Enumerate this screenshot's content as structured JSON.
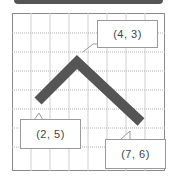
{
  "diagram": {
    "type": "coordinate-grid-with-bent-bar",
    "grid": {
      "columns": 8,
      "rows": 8,
      "solid_line_color": "#c8c8c8",
      "dotted_line_color": "#b0b0b0"
    },
    "shape": {
      "color": "#555555",
      "description": "V-shaped bar (inverted V)"
    },
    "points": [
      {
        "label": "(2, 5)",
        "role": "left-end"
      },
      {
        "label": "(4, 3)",
        "role": "apex"
      },
      {
        "label": "(7, 6)",
        "role": "right-end"
      }
    ]
  },
  "callouts": {
    "apex": "(4, 3)",
    "left_end": "(2, 5)",
    "right_end": "(7, 6)"
  },
  "colors": {
    "bar": "#555555",
    "frame": "#8a8a8a",
    "callout_border": "#9a9a9a",
    "topbar": "#555555"
  }
}
